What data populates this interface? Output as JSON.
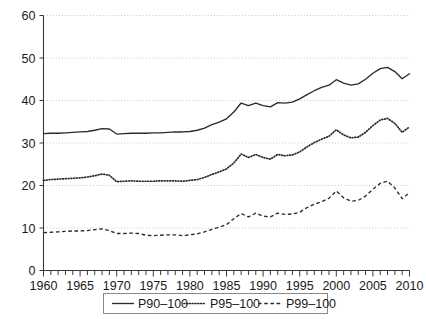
{
  "chart_data": {
    "type": "line",
    "title": "",
    "subtitle": "",
    "xlabel": "",
    "ylabel": "",
    "xlim": [
      1960,
      2010
    ],
    "ylim": [
      0,
      60
    ],
    "grid": "horizontal-dotted",
    "legend_position": "bottom-center",
    "x_tick_labels": [
      "1960",
      "1965",
      "1970",
      "1975",
      "1980",
      "1985",
      "1990",
      "1995",
      "2000",
      "2005",
      "2010"
    ],
    "x_tick_values": [
      1960,
      1965,
      1970,
      1975,
      1980,
      1985,
      1990,
      1995,
      2000,
      2005,
      2010
    ],
    "x_minor_tick_interval": 1,
    "y_tick_labels": [
      "0",
      "10",
      "20",
      "30",
      "40",
      "50",
      "60"
    ],
    "y_tick_values": [
      0,
      10,
      20,
      30,
      40,
      50,
      60
    ],
    "x": [
      1960,
      1961,
      1962,
      1963,
      1964,
      1965,
      1966,
      1967,
      1968,
      1969,
      1970,
      1971,
      1972,
      1973,
      1974,
      1975,
      1976,
      1977,
      1978,
      1979,
      1980,
      1981,
      1982,
      1983,
      1984,
      1985,
      1986,
      1987,
      1988,
      1989,
      1990,
      1991,
      1992,
      1993,
      1994,
      1995,
      1996,
      1997,
      1998,
      1999,
      2000,
      2001,
      2002,
      2003,
      2004,
      2005,
      2006,
      2007,
      2008,
      2009,
      2010
    ],
    "series": [
      {
        "name": "P90-100",
        "style": "solid",
        "values": [
          32.2,
          32.3,
          32.3,
          32.4,
          32.5,
          32.6,
          32.7,
          33.0,
          33.4,
          33.3,
          32.1,
          32.2,
          32.3,
          32.3,
          32.3,
          32.4,
          32.4,
          32.5,
          32.6,
          32.6,
          32.7,
          33.0,
          33.5,
          34.3,
          34.9,
          35.7,
          37.3,
          39.4,
          38.8,
          39.4,
          38.8,
          38.5,
          39.5,
          39.4,
          39.6,
          40.4,
          41.4,
          42.3,
          43.1,
          43.6,
          44.9,
          44.1,
          43.6,
          43.9,
          45.0,
          46.4,
          47.5,
          47.8,
          46.8,
          45.1,
          46.3
        ]
      },
      {
        "name": "P95-100",
        "style": "dotted",
        "values": [
          21.2,
          21.4,
          21.5,
          21.6,
          21.7,
          21.8,
          22.0,
          22.3,
          22.7,
          22.4,
          20.9,
          21.0,
          21.1,
          21.0,
          21.0,
          21.0,
          21.1,
          21.1,
          21.1,
          21.0,
          21.2,
          21.4,
          21.9,
          22.6,
          23.2,
          23.9,
          25.3,
          27.4,
          26.6,
          27.3,
          26.6,
          26.2,
          27.3,
          27.0,
          27.2,
          27.9,
          29.1,
          30.1,
          30.9,
          31.6,
          33.1,
          31.9,
          31.2,
          31.4,
          32.5,
          34.1,
          35.4,
          35.8,
          34.6,
          32.5,
          33.8
        ]
      },
      {
        "name": "P99-100",
        "style": "dashed",
        "values": [
          8.9,
          9.0,
          9.1,
          9.2,
          9.3,
          9.3,
          9.4,
          9.6,
          9.8,
          9.4,
          8.7,
          8.7,
          8.8,
          8.7,
          8.3,
          8.2,
          8.3,
          8.4,
          8.4,
          8.2,
          8.4,
          8.6,
          9.1,
          9.7,
          10.2,
          10.8,
          12.2,
          13.4,
          12.6,
          13.5,
          12.8,
          12.6,
          13.5,
          13.2,
          13.3,
          13.7,
          14.8,
          15.6,
          16.2,
          17.0,
          18.7,
          17.1,
          16.3,
          16.5,
          17.5,
          19.1,
          20.5,
          21.0,
          19.4,
          16.9,
          18.3
        ]
      }
    ]
  },
  "legend": {
    "items": [
      {
        "label": "P90-100",
        "style": "solid"
      },
      {
        "label": "P95-100",
        "style": "dotted"
      },
      {
        "label": "P99-100",
        "style": "dashed"
      }
    ]
  }
}
